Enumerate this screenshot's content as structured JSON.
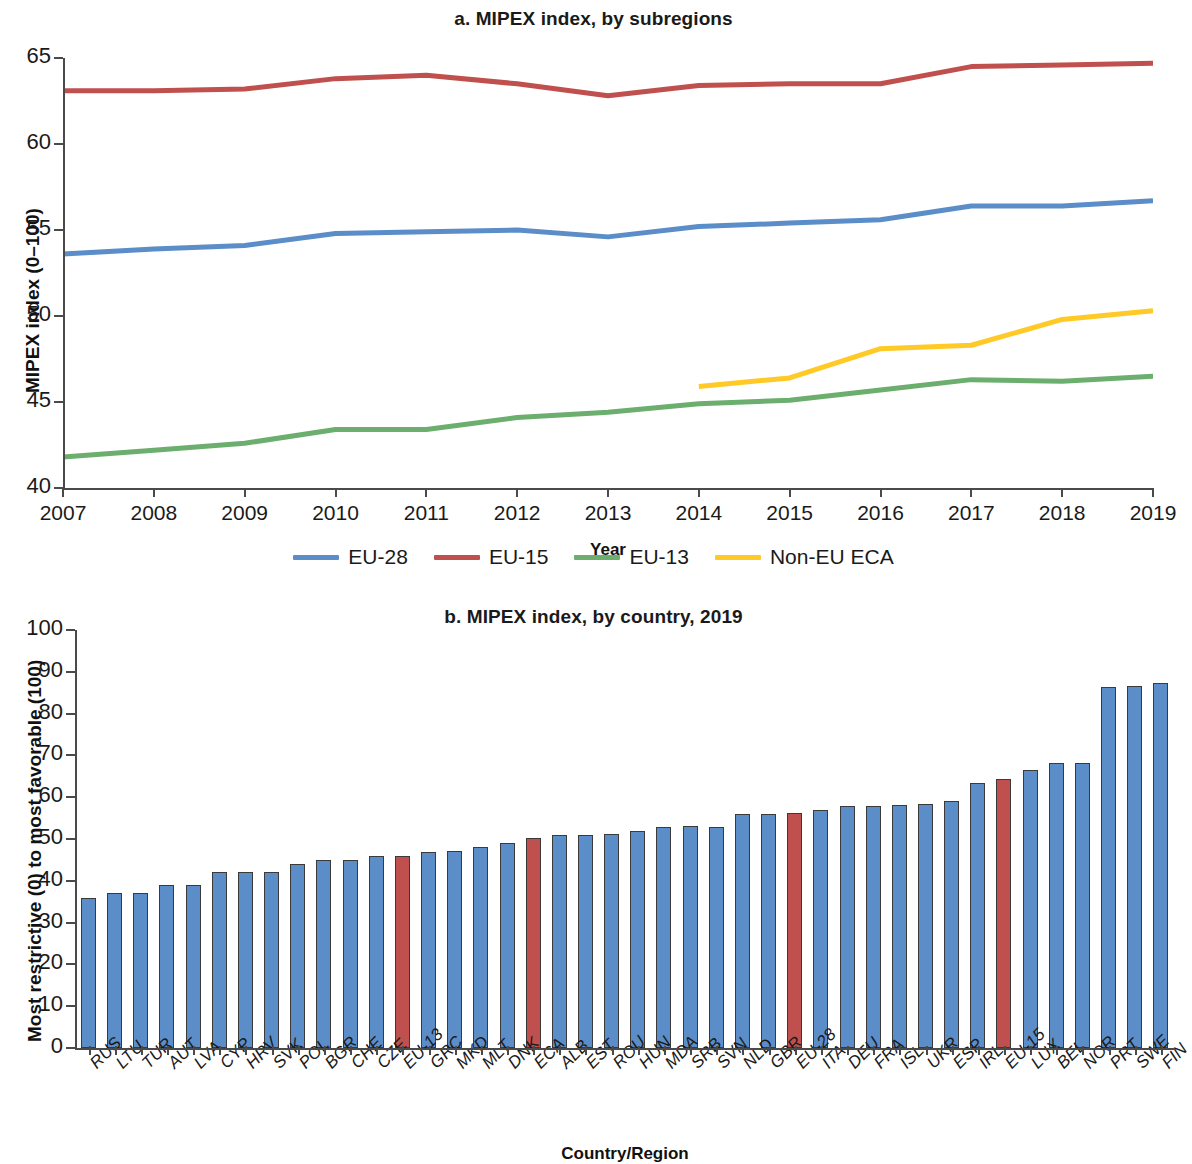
{
  "figure": {
    "panel_a_title": "a. MIPEX index, by subregions",
    "panel_b_title": "b. MIPEX index, by country, 2019"
  },
  "colors": {
    "eu28_blue": "#5B8DC8",
    "eu15_red": "#C0504D",
    "eu13_green": "#6BAE6E",
    "noneu_yellow": "#FFC926",
    "bar_blue": "#5B8DC8",
    "bar_red": "#C0504D",
    "axis": "#4a4a4a"
  },
  "legend": {
    "items": [
      {
        "label": "EU-28",
        "color": "#5B8DC8"
      },
      {
        "label": "EU-15",
        "color": "#C0504D"
      },
      {
        "label": "EU-13",
        "color": "#6BAE6E"
      },
      {
        "label": "Non-EU ECA",
        "color": "#FFC926"
      }
    ]
  },
  "chart_data": [
    {
      "type": "line",
      "panel": "a",
      "title": "a. MIPEX index, by subregions",
      "xlabel": "Year",
      "ylabel": "MIPEX index (0–100)",
      "x": [
        2007,
        2008,
        2009,
        2010,
        2011,
        2012,
        2013,
        2014,
        2015,
        2016,
        2017,
        2018,
        2019
      ],
      "xticks": [
        "2007",
        "2008",
        "2009",
        "2010",
        "2011",
        "2012",
        "2013",
        "2014",
        "2015",
        "2016",
        "2017",
        "2018",
        "2019"
      ],
      "yticks": [
        40,
        45,
        50,
        55,
        60,
        65
      ],
      "xlim": [
        2007,
        2019
      ],
      "ylim": [
        40,
        65
      ],
      "grid": false,
      "legend_position": "below",
      "series": [
        {
          "name": "EU-28",
          "color": "#5B8DC8",
          "values": [
            53.6,
            53.9,
            54.1,
            54.8,
            54.9,
            55.0,
            54.6,
            55.2,
            55.4,
            55.6,
            56.4,
            56.4,
            56.7
          ]
        },
        {
          "name": "EU-15",
          "color": "#C0504D",
          "values": [
            63.1,
            63.1,
            63.2,
            63.8,
            64.0,
            63.5,
            62.8,
            63.4,
            63.5,
            63.5,
            64.5,
            64.6,
            64.7
          ]
        },
        {
          "name": "EU-13",
          "color": "#6BAE6E",
          "values": [
            41.8,
            42.2,
            42.6,
            43.4,
            43.4,
            44.1,
            44.4,
            44.9,
            45.1,
            45.7,
            46.3,
            46.2,
            46.5
          ]
        },
        {
          "name": "Non-EU ECA",
          "color": "#FFC926",
          "values": [
            null,
            null,
            null,
            null,
            null,
            null,
            null,
            45.9,
            46.4,
            48.1,
            48.3,
            49.8,
            50.3
          ]
        }
      ]
    },
    {
      "type": "bar",
      "panel": "b",
      "title": "b. MIPEX index, by country, 2019",
      "xlabel": "Country/Region",
      "ylabel": "Most restrictive (0) to most favorable (100)",
      "yticks": [
        0,
        10,
        20,
        30,
        40,
        50,
        60,
        70,
        80,
        90,
        100
      ],
      "ylim": [
        0,
        100
      ],
      "grid": false,
      "categories": [
        "RUS",
        "LTU",
        "TUR",
        "AUT",
        "LVA",
        "CYP",
        "HRV",
        "SVK",
        "POL",
        "BGR",
        "CHE",
        "CZE",
        "EU-13",
        "GRC",
        "MKD",
        "MLT",
        "DNK",
        "ECA",
        "ALB",
        "EST",
        "ROU",
        "HUN",
        "MDA",
        "SRB",
        "SVN",
        "NLD",
        "GBR",
        "EU-28",
        "ITA",
        "DEU",
        "FRA",
        "ISL",
        "UKR",
        "ESP",
        "IRL",
        "EU-15",
        "LUX",
        "BEL",
        "NOR",
        "PRT",
        "SWE",
        "FIN"
      ],
      "values": [
        36,
        37,
        37,
        39,
        39,
        42,
        42,
        42,
        44,
        45,
        45,
        46,
        46,
        47,
        47.2,
        48,
        49,
        50.2,
        51,
        51,
        51.2,
        52,
        53,
        53.2,
        53,
        56,
        56,
        56.2,
        57,
        58,
        58,
        58.2,
        58.4,
        59,
        63.4,
        64.4,
        66.4,
        68.2,
        68.3,
        86.4,
        86.5,
        87.4
      ],
      "highlight_categories": [
        "EU-13",
        "ECA",
        "EU-28",
        "EU-15"
      ],
      "bar_color": "#5B8DC8",
      "highlight_color": "#C0504D"
    }
  ]
}
